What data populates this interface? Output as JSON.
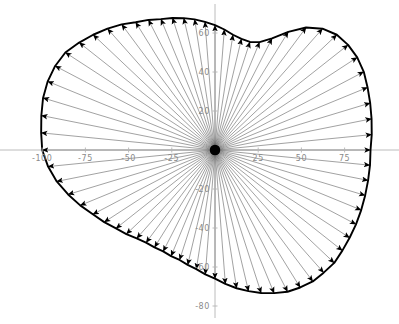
{
  "figure": {
    "title": "",
    "background_color": "#ffffff",
    "width": 399,
    "height": 324
  },
  "axes": {
    "axis_color": "#b4b4b4",
    "tick_label_color": "#8a8a8a",
    "x_ticks": [
      {
        "value": -100,
        "label": "-100"
      },
      {
        "value": -75,
        "label": "-75"
      },
      {
        "value": -50,
        "label": "-50"
      },
      {
        "value": -25,
        "label": "-25"
      },
      {
        "value": 25,
        "label": "25"
      },
      {
        "value": 50,
        "label": "50"
      },
      {
        "value": 75,
        "label": "75"
      }
    ],
    "y_ticks": [
      {
        "value": 60,
        "label": "60"
      },
      {
        "value": 40,
        "label": "40"
      },
      {
        "value": 20,
        "label": "20"
      },
      {
        "value": -20,
        "label": "-20"
      },
      {
        "value": -40,
        "label": "-40"
      },
      {
        "value": -60,
        "label": "-60"
      },
      {
        "value": -80,
        "label": "-80"
      }
    ],
    "xlim": [
      -118,
      107
    ],
    "ylim": [
      -92,
      79
    ]
  },
  "chart_data": {
    "type": "scatter",
    "plot_style": "radial-vector-field",
    "title": "",
    "subtitle": "",
    "xlabel": "",
    "ylabel": "",
    "xlim": [
      -118,
      107
    ],
    "ylim": [
      -92,
      79
    ],
    "grid": false,
    "legend": null,
    "legend_position": "none",
    "annotations": [],
    "origin": [
      0,
      0
    ],
    "arrow_count": 72,
    "arrow_color": "#555555",
    "arrowhead_color": "#000000",
    "boundary_color": "#000000",
    "boundary_closed": true,
    "series": [
      {
        "name": "boundary",
        "angle_unit": "degrees",
        "theta": [
          0,
          5,
          10,
          15,
          20,
          25,
          30,
          35,
          40,
          45,
          50,
          55,
          60,
          65,
          70,
          75,
          80,
          85,
          90,
          95,
          100,
          105,
          110,
          115,
          120,
          125,
          130,
          135,
          140,
          145,
          150,
          155,
          160,
          165,
          170,
          175,
          180,
          185,
          190,
          195,
          200,
          205,
          210,
          215,
          220,
          225,
          230,
          235,
          240,
          245,
          250,
          255,
          260,
          265,
          270,
          275,
          280,
          285,
          290,
          295,
          300,
          305,
          310,
          315,
          320,
          325,
          330,
          335,
          340,
          345,
          350,
          355
        ],
        "r": [
          90,
          91,
          92,
          93,
          94,
          95,
          95,
          94,
          92,
          88,
          82,
          74,
          66,
          61,
          59,
          59,
          60,
          62,
          64,
          66,
          68,
          70,
          72,
          74,
          77,
          80,
          84,
          88,
          92,
          96,
          100,
          102,
          103,
          103,
          102,
          101,
          100,
          97,
          93,
          88,
          83,
          78,
          74,
          70,
          67,
          64,
          62,
          61,
          60,
          60,
          60,
          61,
          62,
          64,
          66,
          69,
          72,
          75,
          78,
          81,
          84,
          86,
          88,
          89,
          90,
          90,
          90,
          90,
          90,
          90,
          90,
          90
        ],
        "x": [
          90,
          90.7,
          90.6,
          89.8,
          88.3,
          86.1,
          82.3,
          77,
          70.5,
          62.2,
          52.7,
          42.4,
          33,
          25.8,
          20.2,
          15.3,
          10.4,
          5.4,
          0,
          -5.8,
          -11.8,
          -18.1,
          -24.6,
          -31.3,
          -38.5,
          -45.9,
          -54,
          -62.2,
          -70.5,
          -78.6,
          -86.6,
          -92.5,
          -96.8,
          -99.5,
          -100.5,
          -100.6,
          -100,
          -96.6,
          -91.6,
          -85,
          -78,
          -70.7,
          -64.1,
          -57.3,
          -51.3,
          -45.3,
          -39.9,
          -35,
          -30,
          -25.4,
          -20.5,
          -15.8,
          -10.8,
          -5.6,
          0,
          6,
          12.5,
          19.4,
          26.7,
          34.2,
          42,
          49.3,
          56.6,
          62.9,
          69,
          73.7,
          77.9,
          81.6,
          84.6,
          86.9,
          88.6,
          89.7
        ],
        "y": [
          0,
          7.9,
          16,
          24.1,
          32.1,
          40.1,
          47.5,
          53.9,
          59.1,
          62.2,
          62.8,
          60.6,
          57.2,
          55.3,
          55.4,
          57,
          59.1,
          61.8,
          64,
          65.7,
          67,
          67.6,
          67.7,
          67.1,
          66.7,
          65.5,
          64.4,
          62.2,
          59.1,
          55.1,
          50,
          43.1,
          35.2,
          26.7,
          17.7,
          8.8,
          0,
          -8.5,
          -16.1,
          -22.8,
          -28.4,
          -33,
          -37,
          -40.2,
          -43.1,
          -45.3,
          -47.5,
          -49.9,
          -52,
          -54.4,
          -56.4,
          -58.9,
          -61.1,
          -63.8,
          -66,
          -68.7,
          -70.9,
          -72.4,
          -73.3,
          -73.4,
          -72.7,
          -70.5,
          -67.4,
          -62.9,
          -57.9,
          -51.6,
          -45,
          -38.1,
          -30.8,
          -23.3,
          -15.6,
          -7.8
        ]
      }
    ]
  }
}
